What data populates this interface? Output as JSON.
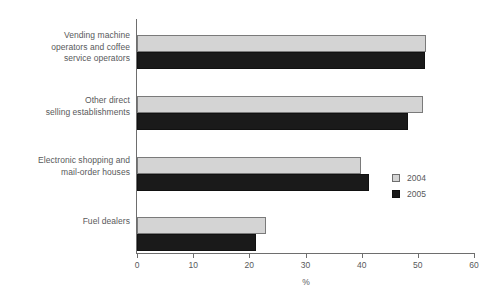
{
  "chart_data": {
    "type": "bar",
    "orientation": "horizontal",
    "title": "",
    "xlabel": "%",
    "ylabel": "",
    "xlim": [
      0,
      60
    ],
    "xticks": [
      0,
      10,
      20,
      30,
      40,
      50,
      60
    ],
    "xtick_labels": [
      "0",
      "10",
      "20",
      "30",
      "40",
      "50",
      "60"
    ],
    "grid": false,
    "legend_position": "center-right",
    "categories": [
      "Vending machine operators and coffee service operators",
      "Other direct selling establishments",
      "Electronic shopping and mail-order houses",
      "Fuel dealers"
    ],
    "category_label_lines": [
      [
        "Vending machine",
        "operators and coffee",
        "service operators"
      ],
      [
        "Other direct",
        "selling establishments"
      ],
      [
        "Electronic shopping and",
        "mail-order houses"
      ],
      [
        "Fuel dealers"
      ]
    ],
    "series": [
      {
        "name": "2004",
        "color": "#d4d4d4",
        "values": [
          51.5,
          50.9,
          39.9,
          23.0
        ]
      },
      {
        "name": "2005",
        "color": "#1a1a1a",
        "values": [
          51.3,
          48.2,
          41.3,
          21.2
        ]
      }
    ]
  },
  "legend": {
    "items": [
      {
        "label": "2004"
      },
      {
        "label": "2005"
      }
    ]
  },
  "axis": {
    "x_title": "%"
  },
  "colors": {
    "series_2004": "#d4d4d4",
    "series_2005": "#1a1a1a",
    "axis": "#6e6e6e",
    "text": "#58595b",
    "background": "#ffffff"
  }
}
